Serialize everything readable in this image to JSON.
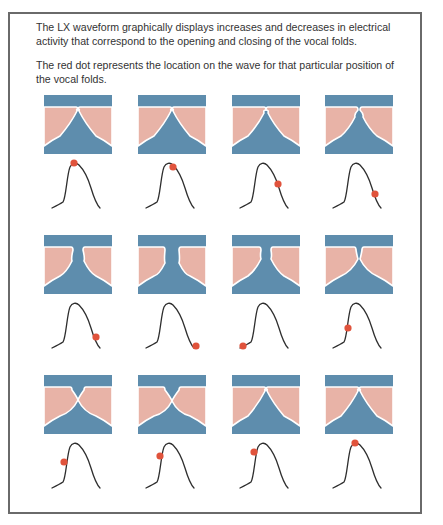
{
  "intro": {
    "paragraph_1": "The LX waveform graphically displays increases and decreases in electrical activity that correspond to the opening and closing of the vocal folds.",
    "paragraph_2": "The red dot represents the location on the wave for that particular position of the vocal folds."
  },
  "colors": {
    "fold_blue": "#5e8dad",
    "fold_pink": "#e8b3a7",
    "fold_edge": "#ffffff",
    "wave_line": "#2e2e2e",
    "dot_red": "#e0533c",
    "frame_border": "#6a6a6a"
  },
  "grid": {
    "columns": [
      36,
      130,
      224,
      317
    ],
    "rows": [
      83,
      223,
      363
    ]
  },
  "cells": [
    {
      "row": 0,
      "col": 0,
      "fold": "closed-top",
      "dot": [
        22,
        1
      ]
    },
    {
      "row": 0,
      "col": 1,
      "fold": "closed-top",
      "dot": [
        27,
        5
      ]
    },
    {
      "row": 0,
      "col": 2,
      "fold": "closed-top-wide",
      "dot": [
        38,
        22
      ]
    },
    {
      "row": 0,
      "col": 3,
      "fold": "narrow-neck",
      "dot": [
        42,
        32
      ]
    },
    {
      "row": 1,
      "col": 0,
      "fold": "open",
      "dot": [
        44,
        35
      ]
    },
    {
      "row": 1,
      "col": 1,
      "fold": "open-wide",
      "dot": [
        50,
        44
      ]
    },
    {
      "row": 1,
      "col": 2,
      "fold": "open-mid",
      "dot": [
        3,
        44
      ]
    },
    {
      "row": 1,
      "col": 3,
      "fold": "closing",
      "dot": [
        15,
        26
      ]
    },
    {
      "row": 2,
      "col": 0,
      "fold": "closed-mid",
      "dot": [
        12,
        20
      ]
    },
    {
      "row": 2,
      "col": 1,
      "fold": "closed-mid-low",
      "dot": [
        14,
        14
      ]
    },
    {
      "row": 2,
      "col": 2,
      "fold": "closed-top",
      "dot": [
        14,
        10
      ]
    },
    {
      "row": 2,
      "col": 3,
      "fold": "closed-top",
      "dot": [
        22,
        1
      ]
    }
  ]
}
